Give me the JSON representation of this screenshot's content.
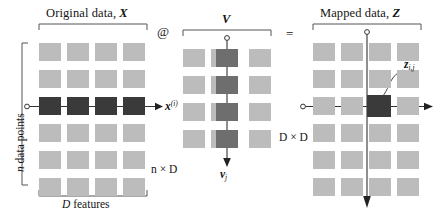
{
  "figure": {
    "caption_elements": {
      "left_title_text": "Original data, ",
      "left_title_symbol": "X",
      "middle_title_symbol": "V",
      "right_title_text": "Mapped data, ",
      "right_title_symbol": "Z",
      "operator_product": "@",
      "operator_equals": "="
    },
    "labels": {
      "rows_left": "n data points",
      "cols_left": "D features",
      "dims_left": "n × D",
      "dims_middle": "D × D",
      "row_vector": "x",
      "row_vector_sup": "(i)",
      "col_vector": "v",
      "col_vector_sub": "j",
      "element": "z",
      "element_sub": "i,j"
    },
    "colors": {
      "cell_light": "#bcbcbc",
      "cell_mid_dark": "#6e6e6e",
      "cell_darkest": "#3a3a3a",
      "ink": "#141414",
      "background": "#ffffff"
    },
    "matrices": [
      {
        "name": "original-data-matrix",
        "rows": 6,
        "cols": 4,
        "highlight_type": "row",
        "highlight_index": 2
      },
      {
        "name": "projection-matrix",
        "rows": 4,
        "cols": 4,
        "highlight_type": "column",
        "highlight_index": 2
      },
      {
        "name": "mapped-data-matrix",
        "rows": 6,
        "cols": 4,
        "highlight_type": "cell",
        "highlight_row": 2,
        "highlight_col": 2
      }
    ]
  }
}
